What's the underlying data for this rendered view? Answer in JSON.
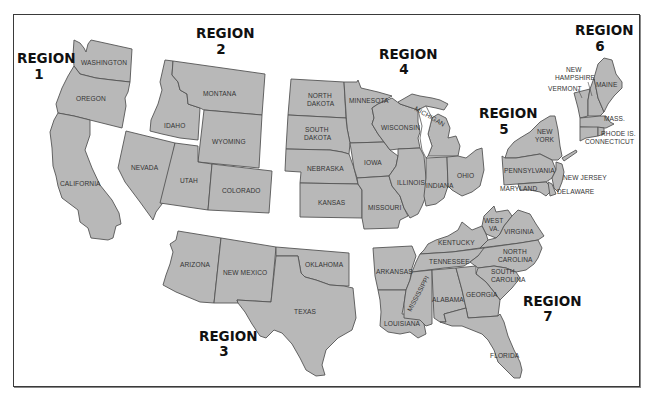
{
  "map": {
    "type": "us-regions-map",
    "fill_color": "#b8b8b8",
    "outline_color": "#555555",
    "regions": [
      {
        "id": "1",
        "title": "REGION",
        "number": "1",
        "states": [
          "WASHINGTON",
          "OREGON",
          "CALIFORNIA"
        ]
      },
      {
        "id": "2",
        "title": "REGION",
        "number": "2",
        "states": [
          "MONTANA",
          "IDAHO",
          "WYOMING",
          "NEVADA",
          "UTAH",
          "COLORADO"
        ]
      },
      {
        "id": "3",
        "title": "REGION",
        "number": "3",
        "states": [
          "ARIZONA",
          "NEW MEXICO",
          "OKLAHOMA",
          "TEXAS"
        ]
      },
      {
        "id": "4",
        "title": "REGION",
        "number": "4",
        "states": [
          "NORTH DAKOTA",
          "MINNESOTA",
          "SOUTH DAKOTA",
          "WISCONSIN",
          "MICHIGAN",
          "NEBRASKA",
          "IOWA",
          "ILLINOIS",
          "INDIANA",
          "OHIO",
          "KANSAS",
          "MISSOURI"
        ]
      },
      {
        "id": "5",
        "title": "REGION",
        "number": "5",
        "states": [
          "NEW YORK",
          "PENNSYLVANIA",
          "NEW JERSEY",
          "MARYLAND",
          "DELAWARE"
        ]
      },
      {
        "id": "6",
        "title": "REGION",
        "number": "6",
        "states": [
          "NEW HAMPSHIRE",
          "VERMONT",
          "MAINE",
          "MASS.",
          "RHODE IS.",
          "CONNECTICUT"
        ]
      },
      {
        "id": "7",
        "title": "REGION",
        "number": "7",
        "states": [
          "WEST VA.",
          "VIRGINIA",
          "KENTUCKY",
          "NORTH CAROLINA",
          "TENNESSEE",
          "SOUTH CAROLINA",
          "ARKANSAS",
          "MISSISSIPPI",
          "ALABAMA",
          "GEORGIA",
          "LOUISIANA",
          "FLORIDA"
        ]
      }
    ],
    "labels": {
      "washington": "WASHINGTON",
      "oregon": "OREGON",
      "california": "CALIFORNIA",
      "montana": "MONTANA",
      "idaho": "IDAHO",
      "wyoming": "WYOMING",
      "nevada": "NEVADA",
      "utah": "UTAH",
      "colorado": "COLORADO",
      "arizona": "ARIZONA",
      "new_mexico": "NEW MEXICO",
      "oklahoma": "OKLAHOMA",
      "texas": "TEXAS",
      "north_dakota_1": "NORTH",
      "north_dakota_2": "DAKOTA",
      "south_dakota_1": "SOUTH",
      "south_dakota_2": "DAKOTA",
      "minnesota": "MINNESOTA",
      "wisconsin": "WISCONSIN",
      "michigan": "MICHIGAN",
      "nebraska": "NEBRASKA",
      "iowa": "IOWA",
      "illinois": "ILLINOIS",
      "indiana": "INDIANA",
      "ohio": "OHIO",
      "kansas": "KANSAS",
      "missouri": "MISSOURI",
      "new_york_1": "NEW",
      "new_york_2": "YORK",
      "pennsylvania": "PENNSYLVANIA",
      "new_jersey": "NEW JERSEY",
      "maryland": "MARYLAND",
      "delaware": "DELAWARE",
      "new_hampshire_1": "NEW",
      "new_hampshire_2": "HAMPSHIRE",
      "vermont": "VERMONT",
      "maine": "MAINE",
      "mass": "MASS.",
      "rhode_island": "RHODE IS.",
      "connecticut": "CONNECTICUT",
      "west_va_1": "WEST",
      "west_va_2": "VA.",
      "virginia": "VIRGINIA",
      "kentucky": "KENTUCKY",
      "north_carolina_1": "NORTH",
      "north_carolina_2": "CAROLINA",
      "tennessee": "TENNESSEE",
      "south_carolina_1": "SOUTH",
      "south_carolina_2": "CAROLINA",
      "arkansas": "ARKANSAS",
      "mississippi": "MISSISSIPPI",
      "alabama": "ALABAMA",
      "georgia": "GEORGIA",
      "louisiana": "LOUISIANA",
      "florida": "FLORIDA"
    }
  }
}
